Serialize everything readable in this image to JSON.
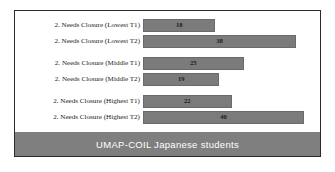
{
  "footer": {
    "caption": "UMAP-COIL Japanese students",
    "background_color": "#7f7f7f",
    "text_color": "#ffffff"
  },
  "frame": {
    "border_color": "#2b2b2b",
    "background_color": "#ffffff"
  },
  "chart_data": {
    "type": "bar",
    "orientation": "horizontal",
    "title": "",
    "xlabel": "",
    "ylabel": "",
    "grid": false,
    "legend": false,
    "xlim": [
      0,
      44
    ],
    "bar_color": "#7b7b7b",
    "categories": [
      "2. Needs Closure (Lowest T1)",
      "2. Needs Closure (Lowest T2)",
      "2. Needs Closure (Middle T1)",
      "2. Needs Closure (Middle T2)",
      "2. Needs Closure (Highest T1)",
      "2. Needs Closure (Highest T2)"
    ],
    "values": [
      18,
      38,
      25,
      19,
      22,
      40
    ],
    "groups": [
      {
        "name": "Lowest",
        "bars": [
          {
            "label": "2. Needs Closure (Lowest T1)",
            "value": 18
          },
          {
            "label": "2. Needs Closure (Lowest T2)",
            "value": 38
          }
        ]
      },
      {
        "name": "Middle",
        "bars": [
          {
            "label": "2. Needs Closure (Middle T1)",
            "value": 25
          },
          {
            "label": "2. Needs Closure (Middle T2)",
            "value": 19
          }
        ]
      },
      {
        "name": "Highest",
        "bars": [
          {
            "label": "2. Needs Closure (Highest T1)",
            "value": 22
          },
          {
            "label": "2. Needs Closure (Highest T2)",
            "value": 40
          }
        ]
      }
    ]
  }
}
